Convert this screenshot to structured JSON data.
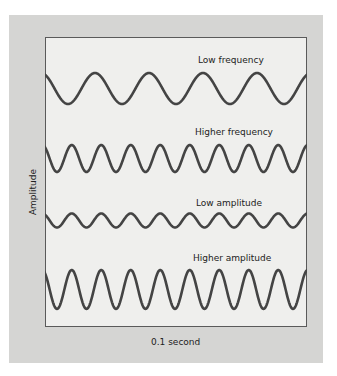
{
  "figure": {
    "y_axis_label": "Amplitude",
    "x_axis_label": "0.1 second",
    "wave_color": "#444444",
    "panel_color": "#d5d5d3",
    "plot_bg_color": "#efefed"
  },
  "waves": [
    {
      "label": "Low frequency",
      "center_y": 88.5,
      "amplitude": 15.5,
      "period": 54,
      "first_trough_x": 68,
      "label_x": 198,
      "label_y": 55
    },
    {
      "label": "Higher frequency",
      "center_y": 158.5,
      "amplitude": 13.5,
      "period": 29.5,
      "first_trough_x": 57,
      "label_x": 195,
      "label_y": 127
    },
    {
      "label": "Low amplitude",
      "center_y": 220.5,
      "amplitude": 7,
      "period": 29.5,
      "first_trough_x": 57,
      "label_x": 196,
      "label_y": 198
    },
    {
      "label": "Higher amplitude",
      "center_y": 289.5,
      "amplitude": 19.5,
      "period": 29.5,
      "first_trough_x": 57,
      "label_x": 193,
      "label_y": 253
    }
  ]
}
